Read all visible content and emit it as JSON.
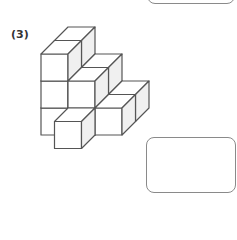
{
  "problem": {
    "number_label": "(3)",
    "figure": {
      "type": "stacked-unit-cubes",
      "cube_size_px": 27,
      "depth_offset_px": [
        13.5,
        -13.5
      ],
      "origin_px": [
        41,
        135
      ],
      "colors": {
        "stroke": "#555555",
        "front": "#ffffff",
        "top": "#ffffff",
        "side": "#f0f0f0"
      },
      "cubes": [
        {
          "col": 0,
          "row": 0,
          "z": 1
        },
        {
          "col": 0,
          "row": 1,
          "z": 1
        },
        {
          "col": 0,
          "row": 2,
          "z": 1
        },
        {
          "col": 1,
          "row": 0,
          "z": 1
        },
        {
          "col": 1,
          "row": 1,
          "z": 1
        },
        {
          "col": 2,
          "row": 0,
          "z": 1
        },
        {
          "col": 0,
          "row": 0,
          "z": 0
        },
        {
          "col": 0,
          "row": 1,
          "z": 0
        },
        {
          "col": 0,
          "row": 2,
          "z": 0
        },
        {
          "col": 1,
          "row": 0,
          "z": 0
        },
        {
          "col": 1,
          "row": 1,
          "z": 0
        },
        {
          "col": 2,
          "row": 0,
          "z": 0
        },
        {
          "col": 1,
          "row": 0,
          "z": -1
        }
      ]
    },
    "answer_boxes": [
      {
        "name": "previous-answer-box",
        "value": ""
      },
      {
        "name": "answer-box",
        "value": ""
      }
    ]
  }
}
